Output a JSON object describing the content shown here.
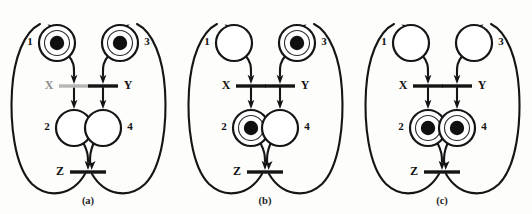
{
  "figure": {
    "type": "petri-net-sequence",
    "panel_count": 3
  },
  "panels": [
    {
      "id": "a",
      "caption": "(a)",
      "places": [
        {
          "id": "p1",
          "label": "1",
          "tokens": 1,
          "label_side": "left"
        },
        {
          "id": "p3",
          "label": "3",
          "tokens": 1,
          "label_side": "right"
        },
        {
          "id": "p2",
          "label": "2",
          "tokens": 0,
          "label_side": "left"
        },
        {
          "id": "p4",
          "label": "4",
          "tokens": 0,
          "label_side": "right"
        }
      ],
      "transitions": [
        {
          "id": "tx",
          "label": "X",
          "label_side": "left",
          "state": "faded"
        },
        {
          "id": "ty",
          "label": "Y",
          "label_side": "right",
          "state": "solid"
        },
        {
          "id": "tz",
          "label": "Z",
          "label_side": "left",
          "state": "solid"
        }
      ]
    },
    {
      "id": "b",
      "caption": "(b)",
      "places": [
        {
          "id": "p1",
          "label": "1",
          "tokens": 0,
          "label_side": "left"
        },
        {
          "id": "p3",
          "label": "3",
          "tokens": 1,
          "label_side": "right"
        },
        {
          "id": "p2",
          "label": "2",
          "tokens": 1,
          "label_side": "left"
        },
        {
          "id": "p4",
          "label": "4",
          "tokens": 0,
          "label_side": "right"
        }
      ],
      "transitions": [
        {
          "id": "tx",
          "label": "X",
          "label_side": "left",
          "state": "solid"
        },
        {
          "id": "ty",
          "label": "Y",
          "label_side": "right",
          "state": "solid"
        },
        {
          "id": "tz",
          "label": "Z",
          "label_side": "left",
          "state": "solid"
        }
      ]
    },
    {
      "id": "c",
      "caption": "(c)",
      "places": [
        {
          "id": "p1",
          "label": "1",
          "tokens": 0,
          "label_side": "left"
        },
        {
          "id": "p3",
          "label": "3",
          "tokens": 0,
          "label_side": "right"
        },
        {
          "id": "p2",
          "label": "2",
          "tokens": 1,
          "label_side": "left"
        },
        {
          "id": "p4",
          "label": "4",
          "tokens": 1,
          "label_side": "right"
        }
      ],
      "transitions": [
        {
          "id": "tx",
          "label": "X",
          "label_side": "left",
          "state": "solid"
        },
        {
          "id": "ty",
          "label": "Y",
          "label_side": "right",
          "state": "solid"
        },
        {
          "id": "tz",
          "label": "Z",
          "label_side": "left",
          "state": "solid"
        }
      ]
    }
  ],
  "colors": {
    "ink": "#151515",
    "faded_ink": "#b6b6b6",
    "background": "#fdfdfc"
  }
}
